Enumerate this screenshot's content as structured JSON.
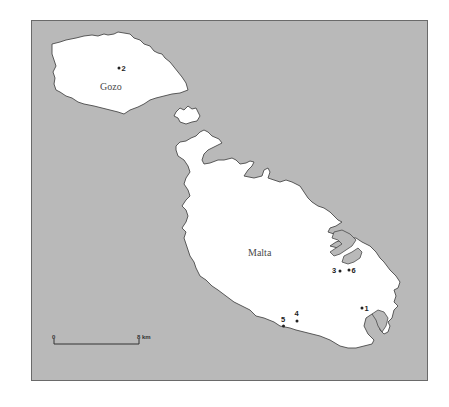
{
  "map": {
    "background_color": "#b9b9b9",
    "land_color": "#ffffff",
    "islands": [
      {
        "name": "Gozo",
        "label": "Gozo"
      },
      {
        "name": "Comino",
        "label": ""
      },
      {
        "name": "Malta",
        "label": "Malta"
      }
    ],
    "sites": [
      {
        "id": "1",
        "label": "1"
      },
      {
        "id": "2",
        "label": "2"
      },
      {
        "id": "3",
        "label": "3"
      },
      {
        "id": "4",
        "label": "4"
      },
      {
        "id": "5",
        "label": "5"
      },
      {
        "id": "6",
        "label": "6"
      }
    ],
    "scale_bar": {
      "start_label": "0",
      "end_label": "8 km"
    }
  }
}
